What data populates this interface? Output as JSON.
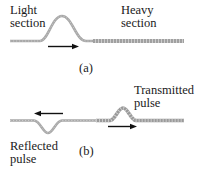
{
  "figure": {
    "panel_a": {
      "caption": "(a)",
      "label_left_line1": "Light",
      "label_left_line2": "section",
      "label_right_line1": "Heavy",
      "label_right_line2": "section",
      "arrow_direction": "right"
    },
    "panel_b": {
      "caption": "(b)",
      "label_transmitted_line1": "Transmitted",
      "label_transmitted_line2": "pulse",
      "label_reflected_line1": "Reflected",
      "label_reflected_line2": "pulse",
      "reflected_arrow_direction": "left",
      "transmitted_arrow_direction": "right"
    },
    "colors": {
      "rope_light": "#a8a8a8",
      "rope_heavy": "#9a9a9a",
      "arrow": "#111111",
      "text": "#1a1a1a"
    }
  }
}
